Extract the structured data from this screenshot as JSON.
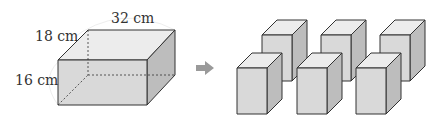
{
  "figure": {
    "big_box": {
      "length_label": "32 cm",
      "width_label": "18 cm",
      "height_label": "16 cm"
    },
    "arrow": "right-arrow",
    "small_blocks": {
      "count": 6,
      "rows": 2,
      "per_row": 3
    },
    "colors": {
      "front_face": "#d8d8d8",
      "top_face": "#eeeeee",
      "side_face": "#bcbcbc",
      "edge": "#333333",
      "arrow": "#9a9a9a"
    }
  }
}
